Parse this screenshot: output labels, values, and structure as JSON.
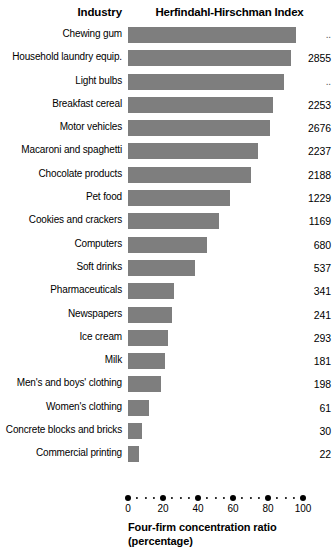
{
  "header": {
    "industry_label": "Industry",
    "hhi_label": "Herfindahl-Hirschman Index"
  },
  "axis": {
    "caption_line1": "Four-firm concentration ratio",
    "caption_line2": "(percentage)",
    "ticks": [
      "0",
      "20",
      "40",
      "60",
      "80",
      "100"
    ]
  },
  "colors": {
    "bar": "#7e7e7e",
    "text": "#000000",
    "background": "#ffffff"
  },
  "chart_data": {
    "type": "bar",
    "orientation": "horizontal",
    "title": "Herfindahl-Hirschman Index",
    "xlabel": "Four-firm concentration ratio (percentage)",
    "ylabel": "Industry",
    "xlim": [
      0,
      100
    ],
    "grid": false,
    "legend": "none",
    "categories": [
      "Chewing gum",
      "Household laundry equip.",
      "Light bulbs",
      "Breakfast cereal",
      "Motor vehicles",
      "Macaroni and spaghetti",
      "Chocolate products",
      "Pet food",
      "Cookies and crackers",
      "Computers",
      "Soft drinks",
      "Pharmaceuticals",
      "Newspapers",
      "Ice cream",
      "Milk",
      "Men's and boys' clothing",
      "Women's clothing",
      "Concrete blocks and bricks",
      "Commercial printing"
    ],
    "values": [
      96,
      93,
      89,
      83,
      81,
      74,
      70,
      58,
      52,
      45,
      38,
      26,
      25,
      23,
      21,
      19,
      12,
      8,
      6
    ],
    "series": [
      {
        "name": "Four-firm concentration ratio",
        "values": [
          96,
          93,
          89,
          83,
          81,
          74,
          70,
          58,
          52,
          45,
          38,
          26,
          25,
          23,
          21,
          19,
          12,
          8,
          6
        ]
      }
    ],
    "annotations": {
      "hhi_label": "Herfindahl-Hirschman Index",
      "hhi_values": [
        "..",
        "2855",
        "..",
        "2253",
        "2676",
        "2237",
        "2188",
        "1229",
        "1169",
        "680",
        "537",
        "341",
        "241",
        "293",
        "181",
        "198",
        "61",
        "30",
        "22"
      ]
    }
  },
  "rows": [
    {
      "label": "Chewing gum",
      "ratio": 96,
      "hhi": ".."
    },
    {
      "label": "Household laundry equip.",
      "ratio": 93,
      "hhi": "2855"
    },
    {
      "label": "Light bulbs",
      "ratio": 89,
      "hhi": ".."
    },
    {
      "label": "Breakfast cereal",
      "ratio": 83,
      "hhi": "2253"
    },
    {
      "label": "Motor vehicles",
      "ratio": 81,
      "hhi": "2676"
    },
    {
      "label": "Macaroni and spaghetti",
      "ratio": 74,
      "hhi": "2237"
    },
    {
      "label": "Chocolate products",
      "ratio": 70,
      "hhi": "2188"
    },
    {
      "label": "Pet food",
      "ratio": 58,
      "hhi": "1229"
    },
    {
      "label": "Cookies and crackers",
      "ratio": 52,
      "hhi": "1169"
    },
    {
      "label": "Computers",
      "ratio": 45,
      "hhi": "680"
    },
    {
      "label": "Soft drinks",
      "ratio": 38,
      "hhi": "537"
    },
    {
      "label": "Pharmaceuticals",
      "ratio": 26,
      "hhi": "341"
    },
    {
      "label": "Newspapers",
      "ratio": 25,
      "hhi": "241"
    },
    {
      "label": "Ice cream",
      "ratio": 23,
      "hhi": "293"
    },
    {
      "label": "Milk",
      "ratio": 21,
      "hhi": "181"
    },
    {
      "label": "Men's and boys' clothing",
      "ratio": 19,
      "hhi": "198"
    },
    {
      "label": "Women's clothing",
      "ratio": 12,
      "hhi": "61"
    },
    {
      "label": "Concrete blocks and bricks",
      "ratio": 8,
      "hhi": "30"
    },
    {
      "label": "Commercial printing",
      "ratio": 6,
      "hhi": "22"
    }
  ]
}
